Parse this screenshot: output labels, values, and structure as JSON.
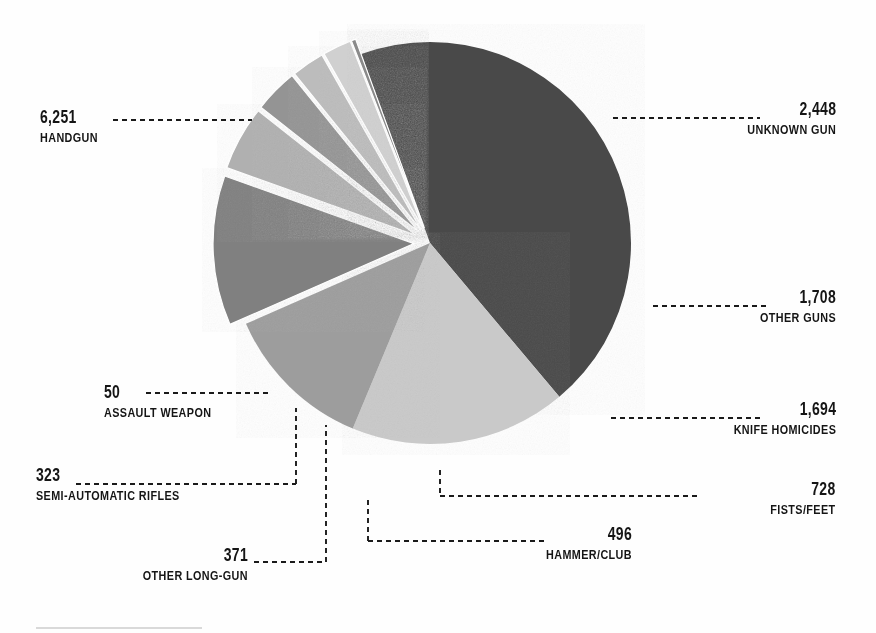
{
  "chart_data": {
    "type": "pie",
    "title": "",
    "subtitle": "",
    "xlabel": "",
    "ylabel": "",
    "total": 14069,
    "legend_position": "callout-labels",
    "grid": false,
    "categories": [
      "HANDGUN",
      "UNKNOWN GUN",
      "OTHER GUNS",
      "KNIFE HOMICIDES",
      "FISTS/FEET",
      "HAMMER/CLUB",
      "OTHER LONG-GUN",
      "SEMI-AUTOMATIC RIFLES",
      "ASSAULT WEAPON"
    ],
    "values": [
      6251,
      2448,
      1708,
      1694,
      728,
      496,
      371,
      323,
      50
    ],
    "value_labels": [
      "6,251",
      "2,448",
      "1,708",
      "1,694",
      "728",
      "496",
      "371",
      "323",
      "50"
    ],
    "colors": [
      "#4a4a4a",
      "#c9c9c9",
      "#9d9d9d",
      "#808080",
      "#b0b0b0",
      "#949494",
      "#bcbcbc",
      "#d0d0d0",
      "#8a8a8a"
    ],
    "exploded": [
      false,
      false,
      false,
      true,
      true,
      true,
      true,
      true,
      true
    ],
    "annotations": []
  },
  "slices": [
    {
      "key": "handgun",
      "name": "HANDGUN",
      "value_label": "6,251",
      "value": 6251,
      "color": "#4a4a4a",
      "label_align": "left",
      "label_x": 40,
      "label_y": 108
    },
    {
      "key": "unknown-gun",
      "name": "UNKNOWN GUN",
      "value_label": "2,448",
      "value": 2448,
      "color": "#c9c9c9",
      "label_align": "right",
      "label_x": 836,
      "label_y": 100
    },
    {
      "key": "other-guns",
      "name": "OTHER GUNS",
      "value_label": "1,708",
      "value": 1708,
      "color": "#9d9d9d",
      "label_align": "right",
      "label_x": 836,
      "label_y": 288
    },
    {
      "key": "knife-homicides",
      "name": "KNIFE HOMICIDES",
      "value_label": "1,694",
      "value": 1694,
      "color": "#808080",
      "label_align": "right",
      "label_x": 836,
      "label_y": 400
    },
    {
      "key": "fists-feet",
      "name": "FISTS/FEET",
      "value_label": "728",
      "value": 728,
      "color": "#b0b0b0",
      "label_align": "right",
      "label_x": 836,
      "label_y": 480
    },
    {
      "key": "hammer-club",
      "name": "HAMMER/CLUB",
      "value_label": "496",
      "value": 496,
      "color": "#949494",
      "label_align": "right",
      "label_x": 632,
      "label_y": 525
    },
    {
      "key": "other-long-gun",
      "name": "OTHER LONG-GUN",
      "value_label": "371",
      "value": 371,
      "color": "#bcbcbc",
      "label_align": "right",
      "label_x": 248,
      "label_y": 546
    },
    {
      "key": "semi-automatic-rifles",
      "name": "SEMI-AUTOMATIC RIFLES",
      "value_label": "323",
      "value": 323,
      "color": "#d0d0d0",
      "label_align": "left",
      "label_x": 36,
      "label_y": 466
    },
    {
      "key": "assault-weapon",
      "name": "ASSAULT WEAPON",
      "value_label": "50",
      "value": 50,
      "color": "#8a8a8a",
      "label_align": "left",
      "label_x": 104,
      "label_y": 383
    }
  ],
  "geometry": {
    "center_x": 430,
    "center_y": 243,
    "radius": 201,
    "explode_offset": 16,
    "background": "#fefefe",
    "leader_color": "#1a1a1a"
  }
}
